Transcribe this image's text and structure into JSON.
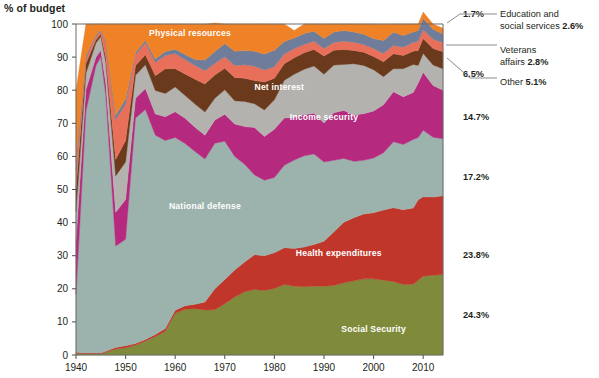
{
  "chart_data": {
    "type": "area",
    "title": "% of budget",
    "xlabel": "",
    "ylabel": "% of budget",
    "ylim": [
      0,
      100
    ],
    "xlim": [
      1940,
      2014
    ],
    "grid": false,
    "legend_position": "in-plot and right-callout",
    "stacked": true,
    "stack_order_bottom_to_top": [
      "Social Security",
      "Health expenditures",
      "National defense",
      "Income security",
      "Net interest",
      "Other",
      "Veterans affairs",
      "Education and social services",
      "Physical resources"
    ],
    "x": [
      1940,
      1942,
      1944,
      1945,
      1946,
      1948,
      1950,
      1952,
      1954,
      1956,
      1958,
      1960,
      1962,
      1964,
      1966,
      1968,
      1970,
      1972,
      1974,
      1976,
      1978,
      1980,
      1982,
      1984,
      1986,
      1988,
      1990,
      1992,
      1994,
      1996,
      1998,
      2000,
      2002,
      2004,
      2006,
      2008,
      2009,
      2010,
      2012,
      2014
    ],
    "series": [
      {
        "name": "Social Security",
        "color": "#7f8b3b",
        "final_pct": "24.3%",
        "label_x": 2000,
        "label_y": 7,
        "values": [
          0.5,
          0.4,
          0.4,
          0.4,
          0.8,
          1.8,
          2.2,
          3.0,
          4.2,
          5.6,
          7.2,
          12.6,
          13.8,
          14.0,
          13.6,
          13.7,
          15.5,
          17.5,
          19.1,
          19.8,
          19.5,
          20.1,
          21.3,
          20.8,
          20.6,
          20.8,
          20.8,
          21.0,
          21.8,
          22.4,
          23.0,
          23.0,
          22.6,
          22.2,
          21.3,
          21.4,
          22.6,
          23.8,
          24.1,
          24.3
        ]
      },
      {
        "name": "Health expenditures",
        "color": "#c1362a",
        "final_pct": "23.8%",
        "label_x": 1993,
        "label_y": 30,
        "values": [
          0.3,
          0.2,
          0.2,
          0.2,
          0.3,
          0.5,
          0.6,
          0.5,
          0.5,
          0.6,
          0.8,
          0.9,
          1.1,
          1.3,
          2.4,
          6.3,
          7.3,
          8.2,
          9.0,
          10.5,
          10.5,
          10.8,
          11.1,
          11.4,
          12.0,
          12.6,
          13.6,
          16.2,
          18.3,
          19.1,
          19.6,
          20.0,
          21.2,
          22.3,
          22.6,
          23.0,
          24.3,
          24.0,
          23.6,
          23.8
        ]
      },
      {
        "name": "National defense",
        "color": "#9cb2ac",
        "final_pct": "17.2%",
        "label_x": 1966,
        "label_y": 44,
        "values": [
          17.5,
          73.0,
          86.7,
          89.5,
          77.3,
          30.6,
          32.2,
          68.1,
          69.5,
          60.2,
          56.8,
          52.2,
          49.0,
          46.2,
          43.2,
          44.0,
          41.8,
          34.3,
          29.5,
          24.1,
          22.8,
          22.7,
          24.9,
          26.7,
          27.6,
          27.3,
          23.9,
          21.6,
          19.3,
          17.0,
          16.2,
          16.5,
          17.3,
          19.9,
          19.7,
          20.7,
          18.8,
          20.1,
          18.1,
          17.2
        ]
      },
      {
        "name": "Income security",
        "color": "#b52a7f",
        "final_pct": "14.7%",
        "label_x": 1990,
        "label_y": 71,
        "values": [
          16.0,
          6.5,
          2.6,
          2.0,
          3.8,
          10.2,
          12.0,
          6.0,
          6.3,
          6.4,
          7.2,
          7.8,
          7.6,
          7.3,
          7.2,
          7.0,
          8.1,
          9.8,
          11.4,
          14.3,
          13.2,
          14.6,
          14.3,
          12.9,
          12.4,
          12.3,
          11.8,
          14.4,
          14.5,
          14.0,
          14.1,
          14.2,
          14.5,
          15.1,
          14.4,
          14.2,
          16.5,
          17.5,
          15.6,
          14.7
        ]
      },
      {
        "name": "Net interest",
        "color": "#b3b2ae",
        "final_pct": "6.5%",
        "label_x": 1981,
        "label_y": 80,
        "values": [
          9.0,
          5.0,
          4.3,
          4.1,
          6.3,
          11.0,
          11.3,
          6.9,
          7.2,
          7.1,
          7.0,
          7.5,
          6.9,
          7.0,
          7.0,
          6.6,
          7.4,
          7.0,
          7.6,
          7.2,
          8.0,
          8.9,
          11.4,
          13.0,
          13.7,
          14.3,
          14.7,
          14.4,
          13.9,
          15.5,
          14.6,
          12.5,
          8.5,
          7.0,
          8.5,
          8.5,
          5.3,
          5.7,
          6.2,
          6.5
        ]
      },
      {
        "name": "Other",
        "color": "#6b3a1c",
        "final_pct": "5.1%",
        "label_x": null,
        "label_y": null,
        "values": [
          7.0,
          3.0,
          1.0,
          0.8,
          1.5,
          5.0,
          6.5,
          3.0,
          3.0,
          4.5,
          7.5,
          5.5,
          6.5,
          7.5,
          8.5,
          7.0,
          6.5,
          7.0,
          7.0,
          7.0,
          8.5,
          6.5,
          5.0,
          5.0,
          5.0,
          5.0,
          5.5,
          4.5,
          4.5,
          4.0,
          4.0,
          4.0,
          4.5,
          4.5,
          4.0,
          4.0,
          4.5,
          4.5,
          5.0,
          5.1
        ]
      },
      {
        "name": "Veterans affairs",
        "color": "#e8705a",
        "final_pct": "2.8%",
        "label_x": null,
        "label_y": null,
        "values": [
          5.5,
          1.5,
          0.9,
          0.8,
          4.5,
          12.0,
          11.0,
          3.2,
          3.6,
          4.0,
          4.0,
          4.6,
          4.3,
          4.2,
          4.0,
          3.5,
          3.5,
          3.7,
          4.1,
          4.3,
          3.6,
          3.5,
          2.9,
          2.8,
          2.5,
          2.5,
          2.3,
          2.3,
          2.5,
          2.5,
          2.3,
          2.4,
          2.5,
          2.5,
          2.5,
          2.6,
          2.8,
          2.7,
          2.8,
          2.8
        ]
      },
      {
        "name": "Education and social services",
        "color": "#6f7d9b",
        "final_pct": "2.6%",
        "label_x": null,
        "label_y": null,
        "values": [
          2.5,
          0.8,
          0.5,
          0.4,
          0.6,
          1.3,
          1.6,
          0.7,
          0.8,
          1.0,
          1.2,
          1.3,
          1.6,
          1.8,
          3.2,
          3.6,
          4.0,
          4.3,
          4.3,
          4.6,
          4.8,
          5.0,
          3.8,
          3.2,
          3.3,
          3.0,
          3.0,
          3.2,
          3.2,
          3.1,
          3.1,
          3.0,
          3.9,
          4.0,
          3.5,
          3.2,
          3.2,
          3.4,
          3.0,
          2.6
        ]
      },
      {
        "name": "Physical resources",
        "color": "#ef8126",
        "final_pct": "1.7%",
        "label_x": 1963,
        "label_y": 96.5,
        "values": [
          21.7,
          9.6,
          3.4,
          1.8,
          4.9,
          27.6,
          22.6,
          8.6,
          4.9,
          10.6,
          8.3,
          7.6,
          9.2,
          10.7,
          10.9,
          8.6,
          5.9,
          8.2,
          8.0,
          8.2,
          9.1,
          7.9,
          5.3,
          2.2,
          2.9,
          2.2,
          4.4,
          2.4,
          2.0,
          2.4,
          3.1,
          4.4,
          4.9,
          2.5,
          3.5,
          2.4,
          2.0,
          1.9,
          1.6,
          1.7
        ]
      }
    ],
    "y_ticks": [
      0,
      10,
      20,
      30,
      40,
      50,
      60,
      70,
      80,
      90,
      100
    ],
    "x_ticks": [
      1940,
      1950,
      1960,
      1970,
      1980,
      1990,
      2000,
      2010
    ],
    "callouts": [
      {
        "text_lines": [
          "Education and",
          "social services"
        ],
        "bold_value": "2.6%"
      },
      {
        "text_lines": [
          "Veterans",
          "affairs"
        ],
        "bold_value": "2.8%"
      },
      {
        "text_lines": [
          "Other"
        ],
        "bold_value": "5.1%"
      }
    ],
    "edge_percent_labels": [
      "1.7%",
      "6.5%",
      "14.7%",
      "17.2%",
      "23.8%",
      "24.3%"
    ]
  }
}
